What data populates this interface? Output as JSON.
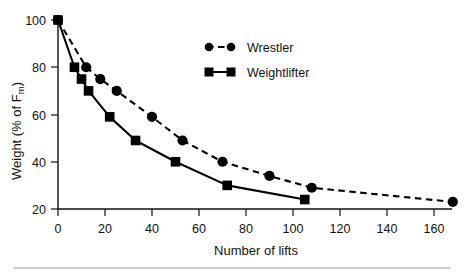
{
  "chart_data": {
    "type": "line",
    "title": "",
    "xlabel": "Number of lifts",
    "ylabel": "Weight (% of Fm)",
    "ylabel_main": "Weight (% of F",
    "ylabel_sub": "m",
    "ylabel_tail": ")",
    "xlim": [
      0,
      175
    ],
    "ylim": [
      20,
      104
    ],
    "xticks": [
      0,
      20,
      40,
      60,
      80,
      100,
      120,
      140,
      160
    ],
    "yticks": [
      20,
      40,
      60,
      80,
      100
    ],
    "xtick_labels": [
      "0",
      "20",
      "40",
      "60",
      "80",
      "100",
      "120",
      "140",
      "160"
    ],
    "ytick_labels": [
      "20",
      "40",
      "60",
      "80",
      "100"
    ],
    "grid": false,
    "legend_position": "upper-center-right",
    "series": [
      {
        "name": "Wrestler",
        "marker": "circle",
        "linestyle": "dashed",
        "color": "#000000",
        "x": [
          0,
          12,
          18,
          25,
          40,
          53,
          70,
          90,
          108,
          168
        ],
        "y": [
          100,
          80,
          75,
          70,
          59,
          49,
          40,
          34,
          29,
          23
        ]
      },
      {
        "name": "Weightlifter",
        "marker": "square",
        "linestyle": "solid",
        "color": "#000000",
        "x": [
          0,
          7,
          10,
          13,
          22,
          33,
          50,
          72,
          105
        ],
        "y": [
          100,
          80,
          75,
          70,
          59,
          49,
          40,
          30,
          24
        ]
      }
    ],
    "legend": [
      {
        "label": "Wrestler",
        "marker": "circle",
        "linestyle": "dashed"
      },
      {
        "label": "Weightlifter",
        "marker": "square",
        "linestyle": "solid"
      }
    ]
  }
}
